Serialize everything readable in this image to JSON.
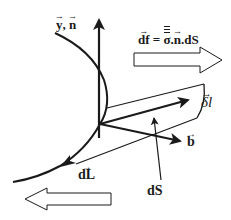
{
  "diagram": {
    "type": "physics-vector-diagram",
    "labels": {
      "y": "y",
      "separator": ", ",
      "n": "n",
      "force_lhs": "df",
      "force_eq": " = ",
      "force_sigma": "σ",
      "force_dot1": ".",
      "force_n": "n",
      "force_dS": ".dS",
      "delta_l": "δl",
      "b": "b",
      "dL": "dL",
      "dS": "dS"
    },
    "elements": [
      {
        "id": "curve",
        "kind": "contour-line",
        "direction": "downward-left"
      },
      {
        "id": "y-n-axis",
        "kind": "vector",
        "label": "y, n",
        "direction": "up"
      },
      {
        "id": "delta-l",
        "kind": "vector",
        "label": "δl",
        "direction": "right-up"
      },
      {
        "id": "b",
        "kind": "vector",
        "label": "b",
        "direction": "right-down"
      },
      {
        "id": "dL",
        "kind": "vector",
        "label": "dL",
        "direction": "down-left along curve"
      },
      {
        "id": "surface-element",
        "kind": "parallelogram",
        "label": "dS"
      },
      {
        "id": "force-arrow",
        "kind": "hollow-arrow",
        "direction": "right",
        "label": "df = σ.n.dS"
      },
      {
        "id": "opposing-arrow",
        "kind": "hollow-arrow",
        "direction": "left"
      }
    ],
    "colors": {
      "stroke": "#1a1a1a",
      "background": "#ffffff"
    }
  }
}
